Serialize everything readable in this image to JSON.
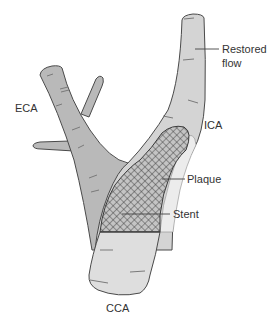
{
  "diagram": {
    "labels": {
      "restored_flow_line1": "Restored",
      "restored_flow_line2": "flow",
      "eca": "ECA",
      "ica": "ICA",
      "plaque": "Plaque",
      "stent": "Stent",
      "cca": "CCA"
    },
    "colors": {
      "vessel_dark": "#b8b8b8",
      "vessel_light": "#dcdcdc",
      "plaque": "#e8e8e8",
      "outline": "#4a4a4a",
      "stent_mesh": "#3a3a3a",
      "text": "#333333"
    }
  }
}
